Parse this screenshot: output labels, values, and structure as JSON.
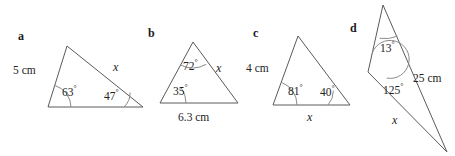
{
  "figure": {
    "background_color": "#ffffff",
    "stroke_color": "#5a5a5a",
    "text_color": "#222222",
    "width": 455,
    "height": 156
  },
  "parts": [
    {
      "label": "a",
      "shape": "triangle",
      "vertices": {
        "apex": [
          67,
          46
        ],
        "bottom_left": [
          48,
          107
        ],
        "bottom_right": [
          143,
          107
        ]
      },
      "sides": [
        {
          "name": "left-side",
          "text": "5 cm",
          "kind": "measure"
        },
        {
          "name": "right-side",
          "text": "x",
          "kind": "unknown"
        }
      ],
      "angles": [
        {
          "name": "bottom-left-angle",
          "value": "63",
          "degree": "°"
        },
        {
          "name": "bottom-right-angle",
          "value": "47",
          "degree": "°"
        }
      ]
    },
    {
      "label": "b",
      "shape": "triangle",
      "vertices": {
        "apex": [
          193,
          42
        ],
        "bottom_left": [
          160,
          103
        ],
        "bottom_right": [
          238,
          103
        ]
      },
      "sides": [
        {
          "name": "right-side",
          "text": "x",
          "kind": "unknown"
        },
        {
          "name": "base-side",
          "text": "6.3 cm",
          "kind": "measure"
        }
      ],
      "angles": [
        {
          "name": "apex-angle",
          "value": "72",
          "degree": "°"
        },
        {
          "name": "bottom-left-angle",
          "value": "35",
          "degree": "°"
        }
      ]
    },
    {
      "label": "c",
      "shape": "triangle",
      "vertices": {
        "apex": [
          298,
          36
        ],
        "bottom_left": [
          273,
          105
        ],
        "bottom_right": [
          350,
          105
        ]
      },
      "sides": [
        {
          "name": "left-side",
          "text": "4 cm",
          "kind": "measure"
        },
        {
          "name": "base-side",
          "text": "x",
          "kind": "unknown"
        }
      ],
      "angles": [
        {
          "name": "bottom-left-angle",
          "value": "81",
          "degree": "°"
        },
        {
          "name": "bottom-right-angle",
          "value": "40",
          "degree": "°"
        }
      ]
    },
    {
      "label": "d",
      "shape": "triangle",
      "vertices": {
        "top": [
          383,
          5
        ],
        "left": [
          368,
          72
        ],
        "bottom_right": [
          447,
          152
        ]
      },
      "sides": [
        {
          "name": "right-side",
          "text": "25 cm",
          "kind": "measure"
        },
        {
          "name": "lower-left-side",
          "text": "x",
          "kind": "unknown"
        }
      ],
      "angles": [
        {
          "name": "top-angle",
          "value": "13",
          "degree": "°"
        },
        {
          "name": "left-angle",
          "value": "125",
          "degree": "°"
        }
      ]
    }
  ],
  "labels": {
    "a": "a",
    "b": "b",
    "c": "c",
    "d": "d",
    "a_left_side": "5 cm",
    "a_right_side": "x",
    "a_angle_left": "63",
    "a_angle_right": "47",
    "b_right_side": "x",
    "b_base": "6.3 cm",
    "b_angle_apex": "72",
    "b_angle_left": "35",
    "c_left_side": "4 cm",
    "c_base": "x",
    "c_angle_left": "81",
    "c_angle_right": "40",
    "d_right_side": "25 cm",
    "d_lower_side": "x",
    "d_angle_top": "13",
    "d_angle_left": "125",
    "degree_symbol": "°"
  }
}
